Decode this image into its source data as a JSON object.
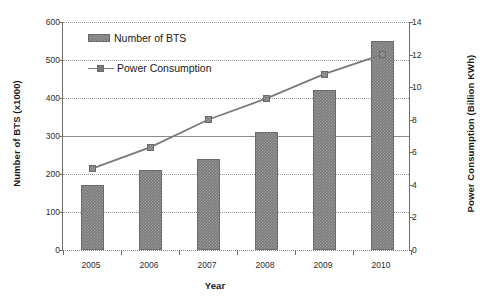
{
  "chart_data": {
    "type": "bar",
    "title": "",
    "xlabel": "Year",
    "ylabel": "Number of BTS (x1000)",
    "y2label": "Power Consumption (Billion KWh)",
    "categories": [
      "2005",
      "2006",
      "2007",
      "2008",
      "2009",
      "2010"
    ],
    "grid": true,
    "legend_position": "upper-left",
    "ylim": [
      0,
      600
    ],
    "yticks": [
      "600",
      "500",
      "400",
      "300",
      "200",
      "100",
      "0"
    ],
    "ylim2": [
      0,
      14
    ],
    "y2ticks": [
      "14",
      "12",
      "10",
      "8",
      "6",
      "4",
      "2",
      "0"
    ],
    "series": [
      {
        "name": "Number of BTS",
        "type": "bar",
        "axis": "left",
        "color": "#7a7a7a",
        "values": [
          170,
          210,
          240,
          310,
          420,
          550
        ]
      },
      {
        "name": "Power Consumption",
        "type": "line",
        "axis": "right",
        "color": "#7a7a7a",
        "values": [
          5.0,
          6.3,
          8.0,
          9.3,
          10.8,
          12.0
        ]
      }
    ]
  },
  "legend": {
    "items": [
      {
        "label": "Number of BTS",
        "marker": "bar-swatch"
      },
      {
        "label": "Power Consumption",
        "marker": "line-marker-swatch"
      }
    ]
  },
  "axes": {
    "left_title": "Number of BTS (x1000)",
    "right_title": "Power Consumption (Billion KWh)",
    "bottom_title": "Year"
  }
}
